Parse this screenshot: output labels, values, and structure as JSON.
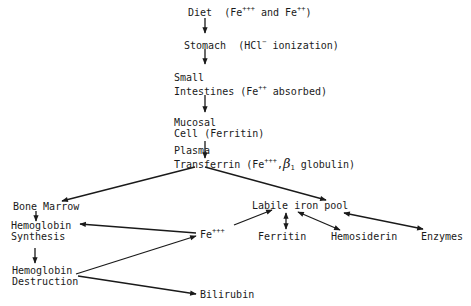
{
  "diagram": {
    "type": "iron metabolism flow",
    "nodes": {
      "diet": {
        "label": "Diet",
        "note_prefix": "(Fe",
        "note_sup1": "+++",
        "note_mid": " and Fe",
        "note_sup2": "++",
        "note_suffix": ")"
      },
      "stomach": {
        "label": "Stomach",
        "note_prefix": "(HCl",
        "note_sup": "−",
        "note_suffix": " ionization)"
      },
      "small_intestines": {
        "line1": "Small",
        "line2": "Intestines",
        "note_prefix": "(Fe",
        "note_sup": "++",
        "note_suffix": " absorbed)"
      },
      "mucosal_cell": {
        "line1": "Mucosal",
        "line2": "Cell",
        "note": "(Ferritin)"
      },
      "plasma_transferrin": {
        "line1": "Plasma",
        "line2": "Transferrin",
        "note_prefix": "(Fe",
        "note_sup": "+++",
        "note_comma": ",",
        "note_beta": "β",
        "note_sub": "1",
        "note_suffix": " globulin)"
      },
      "bone_marrow": {
        "label": "Bone Marrow"
      },
      "hemoglobin_synthesis": {
        "line1": "Hemoglobin",
        "line2": "Synthesis"
      },
      "hemoglobin_destruction": {
        "line1": "Hemoglobin",
        "line2": "Destruction"
      },
      "fe3": {
        "label": "Fe",
        "sup": "+++"
      },
      "labile_iron_pool": {
        "label": "Labile iron pool"
      },
      "ferritin": {
        "label": "Ferritin"
      },
      "hemosiderin": {
        "label": "Hemosiderin"
      },
      "enzymes": {
        "label": "Enzymes"
      },
      "bilirubin": {
        "label": "Bilirubin"
      }
    },
    "edges": [
      {
        "from": "diet",
        "to": "stomach"
      },
      {
        "from": "stomach",
        "to": "small_intestines"
      },
      {
        "from": "small_intestines",
        "to": "mucosal_cell"
      },
      {
        "from": "mucosal_cell",
        "to": "plasma_transferrin"
      },
      {
        "from": "plasma_transferrin",
        "to": "bone_marrow"
      },
      {
        "from": "plasma_transferrin",
        "to": "labile_iron_pool"
      },
      {
        "from": "bone_marrow",
        "to": "hemoglobin_synthesis"
      },
      {
        "from": "hemoglobin_synthesis",
        "to": "hemoglobin_destruction"
      },
      {
        "from": "fe3",
        "to": "hemoglobin_synthesis"
      },
      {
        "from": "hemoglobin_destruction",
        "to": "fe3"
      },
      {
        "from": "hemoglobin_destruction",
        "to": "bilirubin"
      },
      {
        "from": "fe3",
        "to": "labile_iron_pool"
      },
      {
        "from": "labile_iron_pool",
        "to": "ferritin",
        "bidirectional": true
      },
      {
        "from": "labile_iron_pool",
        "to": "hemosiderin",
        "bidirectional": true
      },
      {
        "from": "labile_iron_pool",
        "to": "enzymes",
        "bidirectional": true
      }
    ],
    "colors": {
      "ink": "#1a1a1a",
      "background": "#ffffff"
    }
  }
}
